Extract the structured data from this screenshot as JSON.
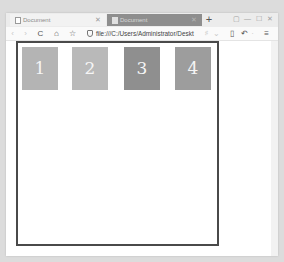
{
  "browser": {
    "tabs": [
      {
        "label": "Document",
        "active": false
      },
      {
        "label": "Document",
        "active": true
      }
    ],
    "new_tab_label": "+",
    "window_controls": {
      "pin": "▢",
      "minimize": "—",
      "maximize": "☐",
      "close": "✕"
    },
    "nav": {
      "back": "‹",
      "forward": "›",
      "reload": "C",
      "home": "⌂",
      "star": "☆"
    },
    "url": "file:///C:/Users/Administrator/Deskt",
    "url_suffix_icons": {
      "bookmark": "♯",
      "dropdown": "⌄"
    },
    "toolbar": {
      "reader": "▯",
      "undo": "↶",
      "undo_dropdown": "·",
      "menu": "≡"
    }
  },
  "page": {
    "boxes": [
      {
        "label": "1",
        "color": "#b4b4b4"
      },
      {
        "label": "2",
        "color": "#b9b9b9"
      },
      {
        "label": "3",
        "color": "#8f8f8f"
      },
      {
        "label": "4",
        "color": "#9d9d9d"
      }
    ],
    "frame_border_color": "#4a4a4a"
  }
}
